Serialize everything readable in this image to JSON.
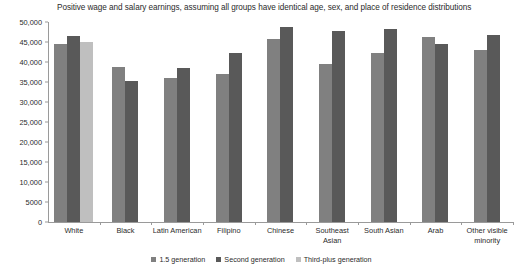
{
  "chart_data": {
    "type": "bar",
    "title": "Positive wage and salary earnings, assuming all groups have identical age, sex, and place of residence distributions",
    "xlabel": "",
    "ylabel": "",
    "ylim": [
      0,
      50000
    ],
    "ytick_labels": [
      "50,000",
      "45,000",
      "40,000",
      "35,000",
      "30,000",
      "25,000",
      "20,000",
      "15,000",
      "10,000",
      "5000",
      "0"
    ],
    "ytick_values": [
      50000,
      45000,
      40000,
      35000,
      30000,
      25000,
      20000,
      15000,
      10000,
      5000,
      0
    ],
    "grid": false,
    "legend_position": "bottom",
    "categories": [
      "White",
      "Black",
      "Latin American",
      "Filipino",
      "Chinese",
      "Southeast Asian",
      "South Asian",
      "Arab",
      "Other visible minority"
    ],
    "series": [
      {
        "name": "1.5 generation",
        "color": "#808080",
        "values": [
          44400,
          38700,
          36000,
          36900,
          45700,
          39400,
          42200,
          46300,
          43000
        ]
      },
      {
        "name": "Second generation",
        "color": "#595959",
        "values": [
          46500,
          35200,
          38500,
          42200,
          48700,
          47800,
          48200,
          44600,
          46800
        ]
      },
      {
        "name": "Third-plus generation",
        "color": "#bfbfbf",
        "values": [
          44900,
          null,
          null,
          null,
          null,
          null,
          null,
          null,
          null
        ]
      }
    ]
  },
  "legend": {
    "items": [
      {
        "label": "1.5 generation"
      },
      {
        "label": "Second generation"
      },
      {
        "label": "Third-plus generation"
      }
    ]
  }
}
